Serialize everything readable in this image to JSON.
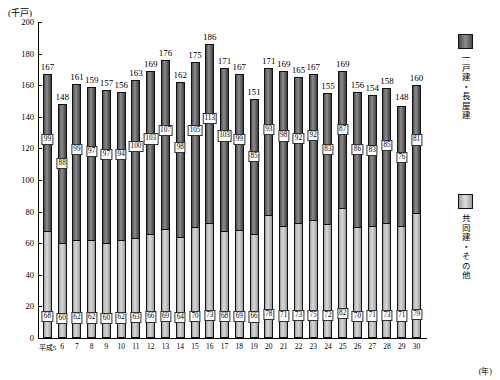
{
  "axis": {
    "y_unit": "(千戸)",
    "x_unit": "(年)",
    "y_ticks": [
      "200",
      "180",
      "160",
      "140",
      "120",
      "100",
      "80",
      "60",
      "40",
      "20",
      "0"
    ]
  },
  "legend": {
    "items": [
      {
        "name": "detached-and-row-houses",
        "label": "一戸建・長屋建",
        "color": "#6f6f6f"
      },
      {
        "name": "apartments-and-others",
        "label": "共同建・その他",
        "color": "#c9c9c9"
      }
    ]
  },
  "chart_data": {
    "type": "bar",
    "subtype": "stacked-vertical",
    "title": "",
    "xlabel": "(年)",
    "ylabel": "(千戸)",
    "ylim": [
      0,
      200
    ],
    "ytick_step": 20,
    "grid": false,
    "legend_position": "right",
    "categories": [
      "平成5",
      "6",
      "7",
      "8",
      "9",
      "10",
      "11",
      "12",
      "13",
      "14",
      "15",
      "16",
      "17",
      "18",
      "19",
      "20",
      "21",
      "22",
      "23",
      "24",
      "25",
      "26",
      "27",
      "28",
      "29",
      "30"
    ],
    "series": [
      {
        "name": "共同建・その他",
        "key": "apartments_others",
        "values": [
          68,
          60,
          62,
          62,
          60,
          62,
          63,
          66,
          69,
          64,
          70,
          73,
          68,
          69,
          66,
          78,
          71,
          73,
          75,
          72,
          82,
          70,
          71,
          73,
          71,
          79
        ]
      },
      {
        "name": "一戸建・長屋建",
        "key": "detached_row",
        "values": [
          99,
          88,
          99,
          97,
          97,
          94,
          100,
          103,
          107,
          98,
          105,
          113,
          103,
          99,
          85,
          93,
          98,
          92,
          92,
          83,
          87,
          86,
          83,
          85,
          76,
          81
        ]
      }
    ],
    "totals": [
      167,
      148,
      161,
      159,
      157,
      156,
      163,
      169,
      176,
      162,
      175,
      186,
      171,
      167,
      151,
      171,
      169,
      165,
      167,
      155,
      169,
      156,
      154,
      158,
      148,
      160
    ]
  }
}
